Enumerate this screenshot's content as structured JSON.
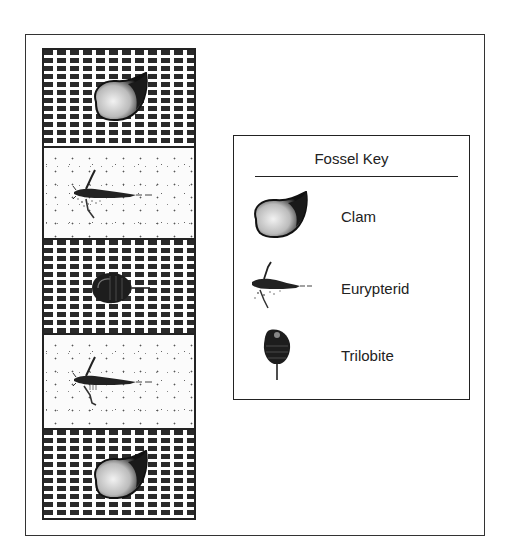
{
  "diagram": {
    "type": "stratigraphic rock column with fossil key",
    "column": {
      "layers_top_to_bottom": [
        {
          "index": 1,
          "rock": "shale",
          "pattern": "dashed-lines",
          "fossil": "Clam"
        },
        {
          "index": 2,
          "rock": "sandstone",
          "pattern": "stippled-dots",
          "fossil": "Eurypterid"
        },
        {
          "index": 3,
          "rock": "shale",
          "pattern": "dashed-lines",
          "fossil": "Trilobite"
        },
        {
          "index": 4,
          "rock": "sandstone",
          "pattern": "stippled-dots",
          "fossil": "Eurypterid"
        },
        {
          "index": 5,
          "rock": "shale",
          "pattern": "dashed-lines",
          "fossil": "Clam"
        }
      ]
    },
    "key": {
      "title": "Fossel Key",
      "items": [
        {
          "icon": "clam-icon",
          "label": "Clam"
        },
        {
          "icon": "eurypterid-icon",
          "label": "Eurypterid"
        },
        {
          "icon": "trilobite-icon",
          "label": "Trilobite"
        }
      ]
    }
  }
}
